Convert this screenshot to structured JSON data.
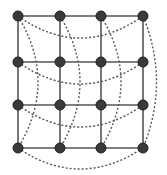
{
  "diagram": {
    "type": "torus-grid",
    "rows": 4,
    "cols": 4,
    "colors": {
      "node_fill": "#3a3a3a",
      "node_stroke": "#1e1e1e",
      "edge": "#555555",
      "background": "#ffffff"
    },
    "node_radius": 5,
    "col_x": [
      18,
      60,
      101,
      143
    ],
    "row_y": [
      16,
      62,
      105,
      148
    ],
    "grid_edges": "solid",
    "wraparound_edges": "dotted",
    "horizontal_wrap": [
      {
        "row": 0,
        "from": [
          18,
          16
        ],
        "to": [
          143,
          16
        ],
        "control": [
          80,
          60
        ]
      },
      {
        "row": 1,
        "from": [
          18,
          62
        ],
        "to": [
          143,
          62
        ],
        "control": [
          80,
          106
        ]
      },
      {
        "row": 2,
        "from": [
          18,
          105
        ],
        "to": [
          143,
          105
        ],
        "control": [
          80,
          149
        ]
      },
      {
        "row": 3,
        "from": [
          18,
          148
        ],
        "to": [
          143,
          148
        ],
        "control": [
          80,
          190
        ]
      }
    ],
    "vertical_wrap": [
      {
        "col": 0,
        "from": [
          18,
          16
        ],
        "to": [
          18,
          148
        ],
        "control": [
          58,
          82
        ]
      },
      {
        "col": 1,
        "from": [
          60,
          16
        ],
        "to": [
          60,
          148
        ],
        "control": [
          100,
          82
        ]
      },
      {
        "col": 2,
        "from": [
          101,
          16
        ],
        "to": [
          101,
          148
        ],
        "control": [
          141,
          82
        ]
      },
      {
        "col": 3,
        "from": [
          143,
          16
        ],
        "to": [
          143,
          148
        ],
        "control": [
          170,
          82
        ]
      }
    ]
  }
}
